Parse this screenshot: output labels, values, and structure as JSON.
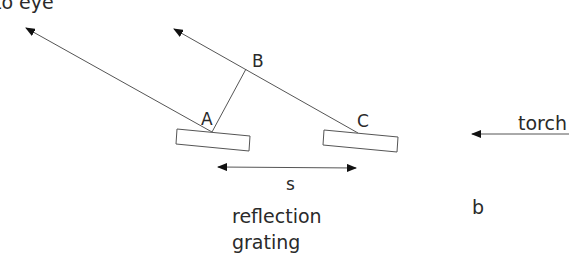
{
  "diagram": {
    "title_label": "to eye",
    "points": {
      "A": "A",
      "B": "B",
      "C": "C"
    },
    "source_label": "torch",
    "spacing_label": "s",
    "grating_label_line1": "reflection",
    "grating_label_line2": "grating",
    "panel_label": "b",
    "colors": {
      "line": "#555555",
      "text": "#2a2a2a",
      "arrow": "#111111"
    }
  }
}
